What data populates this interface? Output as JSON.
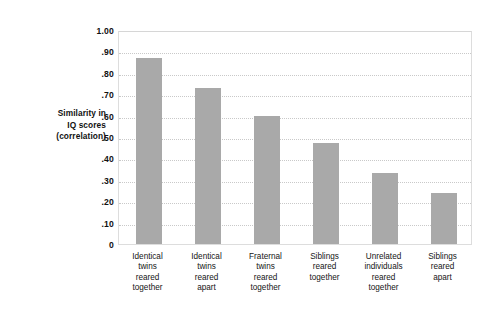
{
  "chart_data": {
    "type": "bar",
    "title": "",
    "subtitle": "",
    "xlabel": "",
    "ylabel": "Similarity in IQ scores (correlation)",
    "ylabel_lines": [
      "Similarity in",
      "IQ scores",
      "(correlation)"
    ],
    "ylim": [
      0,
      1.0
    ],
    "ytick_values": [
      1.0,
      0.9,
      0.8,
      0.7,
      0.6,
      0.5,
      0.4,
      0.3,
      0.2,
      0.1,
      0
    ],
    "ytick_labels": [
      "1.00",
      ".90",
      ".80",
      ".70",
      ".60",
      ".50",
      ".40",
      ".30",
      ".20",
      ".10",
      "0"
    ],
    "grid": true,
    "grid_style": "dotted",
    "grid_axis": "y",
    "legend": false,
    "legend_position": "none",
    "bar_color": "#a9a9a9",
    "categories": [
      "Identical twins reared together",
      "Identical twins reared apart",
      "Fraternal twins reared together",
      "Siblings reared together",
      "Unrelated individuals reared together",
      "Siblings reared apart"
    ],
    "category_lines": [
      [
        "Identical",
        "twins",
        "reared",
        "together"
      ],
      [
        "Identical",
        "twins",
        "reared",
        "apart"
      ],
      [
        "Fraternal",
        "twins",
        "reared",
        "together"
      ],
      [
        "Siblings",
        "reared",
        "together"
      ],
      [
        "Unrelated",
        "individuals",
        "reared",
        "together"
      ],
      [
        "Siblings",
        "reared",
        "apart"
      ]
    ],
    "values": [
      0.87,
      0.73,
      0.6,
      0.47,
      0.33,
      0.24
    ]
  }
}
